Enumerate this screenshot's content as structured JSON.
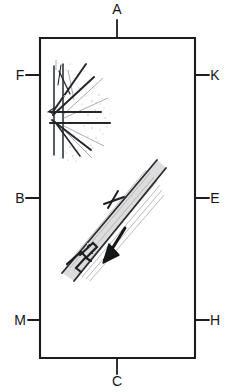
{
  "figure": {
    "kind": "hand-drawn-structural-sketch",
    "background_color": "#ffffff",
    "ink_color": "#1b1d21",
    "pencil_color": "#9a9a9c",
    "frame": {
      "x": 40,
      "y": 38,
      "width": 155,
      "height": 320,
      "stroke_color": "#1b1d21"
    }
  },
  "labels": {
    "top": {
      "text": "A",
      "x": 117,
      "y": 14,
      "tick_from_y": 20,
      "tick_to_y": 38,
      "side": "top"
    },
    "bottom": {
      "text": "C",
      "x": 117,
      "y": 386,
      "tick_from_y": 358,
      "tick_to_y": 374,
      "side": "bottom"
    },
    "left": [
      {
        "text": "F",
        "x": 18,
        "y": 80,
        "tick_y": 75,
        "tick_from_x": 26,
        "tick_to_x": 40,
        "side": "left"
      },
      {
        "text": "B",
        "x": 18,
        "y": 203,
        "tick_y": 198,
        "tick_from_x": 26,
        "tick_to_x": 40,
        "side": "left"
      },
      {
        "text": "M",
        "x": 15,
        "y": 325,
        "tick_y": 320,
        "tick_from_x": 28,
        "tick_to_x": 40,
        "side": "left"
      }
    ],
    "right": [
      {
        "text": "K",
        "x": 210,
        "y": 80,
        "tick_y": 75,
        "tick_from_x": 195,
        "tick_to_x": 209,
        "side": "right"
      },
      {
        "text": "E",
        "x": 210,
        "y": 203,
        "tick_y": 198,
        "tick_from_x": 195,
        "tick_to_x": 209,
        "side": "right"
      },
      {
        "text": "H",
        "x": 210,
        "y": 325,
        "tick_y": 320,
        "tick_from_x": 195,
        "tick_to_x": 209,
        "side": "right"
      }
    ]
  },
  "features": {
    "fan_hatch": {
      "name": "fan-hatch-region",
      "description": "fan / burst of radiating lines with stipple shading in upper-left of frame",
      "bounds": {
        "x": 48,
        "y": 60,
        "width": 62,
        "height": 100
      },
      "vertical_lines": [
        {
          "x1": 54,
          "y1": 66,
          "x2": 54,
          "y2": 155
        },
        {
          "x1": 63,
          "y1": 64,
          "x2": 63,
          "y2": 158
        }
      ],
      "radiating_lines": [
        {
          "x1": 50,
          "y1": 112,
          "x2": 101,
          "y2": 112
        },
        {
          "x1": 50,
          "y1": 123,
          "x2": 110,
          "y2": 123
        },
        {
          "x1": 52,
          "y1": 112,
          "x2": 84,
          "y2": 66
        },
        {
          "x1": 52,
          "y1": 114,
          "x2": 92,
          "y2": 78
        },
        {
          "x1": 52,
          "y1": 120,
          "x2": 90,
          "y2": 148
        },
        {
          "x1": 54,
          "y1": 122,
          "x2": 80,
          "y2": 155
        },
        {
          "x1": 58,
          "y1": 72,
          "x2": 68,
          "y2": 92
        },
        {
          "x1": 60,
          "y1": 66,
          "x2": 58,
          "y2": 86
        }
      ],
      "stipple_count": 46
    },
    "dike_band": {
      "name": "dike-band",
      "description": "diagonal twin-line band (dike/vein) running lower-left to upper-right",
      "edge_a": {
        "x1": 62,
        "y1": 273,
        "x2": 157,
        "y2": 160
      },
      "edge_b": {
        "x1": 74,
        "y1": 281,
        "x2": 166,
        "y2": 168
      },
      "fill_color": "#c9c9cb",
      "interior_hatch_count": 7
    },
    "cross_marker": {
      "name": "cross-marker",
      "description": "plus / cross symbol drawn across the band",
      "x": 113,
      "y": 200,
      "size": 13
    },
    "offset_step_marker": {
      "name": "offset-step-marker",
      "description": "zig-zag step symbol marking an offset on the band",
      "points": "80,254 92,244 96,247 86,257 90,260",
      "second_points": "68,264 82,253 86,257 76,268 80,271"
    },
    "motion_arrow": {
      "name": "motion-arrow",
      "description": "thick arrow pointing down and to the left",
      "shaft": {
        "x1": 124,
        "y1": 229,
        "x2": 106,
        "y2": 258
      },
      "head": "104,262 108,246 118,254"
    }
  }
}
